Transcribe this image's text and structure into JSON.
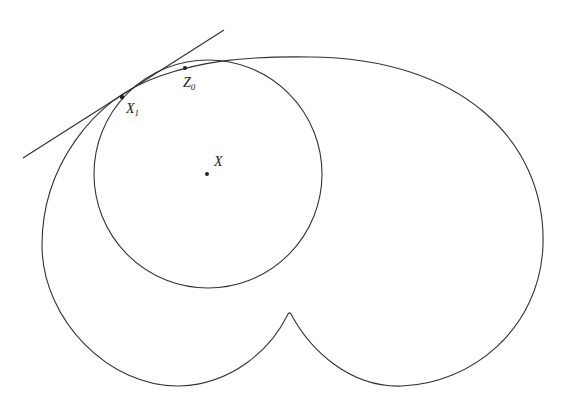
{
  "diagram": {
    "labels": {
      "x": "X",
      "x1_main": "X",
      "x1_sub": "1",
      "z0_main": "Z",
      "z0_sub": "0"
    },
    "points": {
      "X": [
        207,
        174
      ],
      "X1": [
        122,
        97
      ],
      "Z0": [
        185,
        68
      ]
    },
    "circle": {
      "cx": 208,
      "cy": 174,
      "r": 114
    },
    "tangent_line": {
      "from": [
        23,
        158
      ],
      "to": [
        224,
        30
      ]
    },
    "stroke_color": "#333333"
  }
}
